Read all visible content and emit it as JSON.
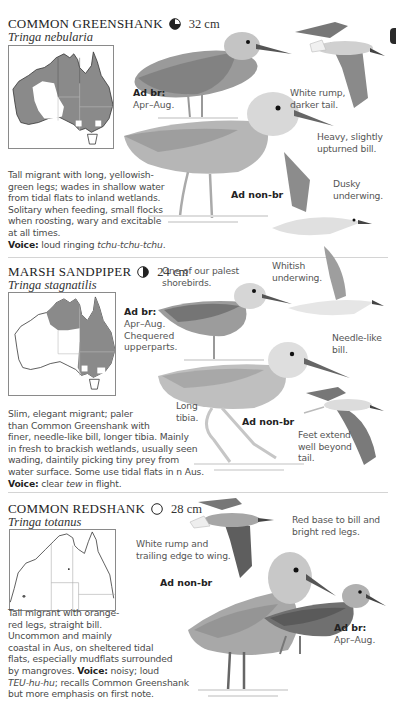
{
  "page": {
    "edge_tab_color": "#2a2a2a",
    "divider_color": "#d4d4d4"
  },
  "species": [
    {
      "common_name": "COMMON GREENSHANK",
      "status_icon": "three-quarter-filled-circle-icon",
      "length": "32 cm",
      "scientific_name": "Tringa nebularia",
      "description_lines": [
        "Tall migrant with long, yellowish-",
        "green legs; wades in shallow water",
        "from tidal flats to inland wetlands.",
        "Solitary when feeding, small flocks",
        "when roosting, wary and excitable",
        "at all times."
      ],
      "voice_label": "Voice:",
      "voice_text": " loud ringing ",
      "voice_call": "tchu-tchu-tchu",
      "voice_end": ".",
      "plumages": [
        {
          "label": "Ad br:",
          "sub": [
            "Apr–Aug."
          ]
        },
        {
          "label": "Ad non-br",
          "sub": []
        }
      ],
      "notes": [
        [
          "White rump,",
          "darker tail."
        ],
        [
          "Heavy, slightly",
          "upturned bill."
        ],
        [
          "Dusky",
          "underwing."
        ]
      ]
    },
    {
      "common_name": "MARSH SANDPIPER",
      "status_icon": "half-filled-circle-icon",
      "length": "24 cm",
      "scientific_name": "Tringa stagnatilis",
      "description_lines": [
        "Slim, elegant migrant; paler",
        "than Common Greenshank with",
        "finer, needle-like bill, longer tibia. Mainly",
        "in fresh to brackish wetlands, usually seen",
        "wading, daintily picking tiny prey from",
        "water surface. Some use tidal flats in n Aus."
      ],
      "voice_label": "Voice:",
      "voice_text": " clear ",
      "voice_call": "tew",
      "voice_end": " in flight.",
      "plumages": [
        {
          "label": "Ad br:",
          "sub": [
            "Apr–Aug.",
            "Chequered",
            "upperparts."
          ]
        },
        {
          "label": "Ad non-br",
          "sub": []
        }
      ],
      "notes": [
        [
          "One of our palest",
          "shorebirds."
        ],
        [
          "Whitish",
          "underwing."
        ],
        [
          "Needle-like",
          "bill."
        ],
        [
          "Long",
          "tibia."
        ],
        [
          "Feet extend",
          "well beyond",
          "tail."
        ]
      ]
    },
    {
      "common_name": "COMMON REDSHANK",
      "status_icon": "empty-circle-icon",
      "length": "28 cm",
      "scientific_name": "Tringa totanus",
      "description_lines": [
        "Tall migrant with orange-",
        "red legs, straight bill.",
        "Uncommon and mainly",
        "coastal in Aus, on sheltered tidal",
        "flats, especially mudflats surrounded"
      ],
      "voice_prefix": "by mangroves. ",
      "voice_label": "Voice:",
      "voice_text": " noisy; loud",
      "voice_call": "TEU-hu-hu",
      "voice_end": "; recalls Common Greenshank",
      "voice_last_line": "but more emphasis on first note.",
      "plumages": [
        {
          "label": "Ad non-br",
          "sub": []
        },
        {
          "label": "Ad br:",
          "sub": [
            "Apr–Aug."
          ]
        }
      ],
      "notes": [
        [
          "White rump and",
          "trailing edge to wing."
        ],
        [
          "Red base to bill and",
          "bright red legs."
        ]
      ]
    }
  ]
}
